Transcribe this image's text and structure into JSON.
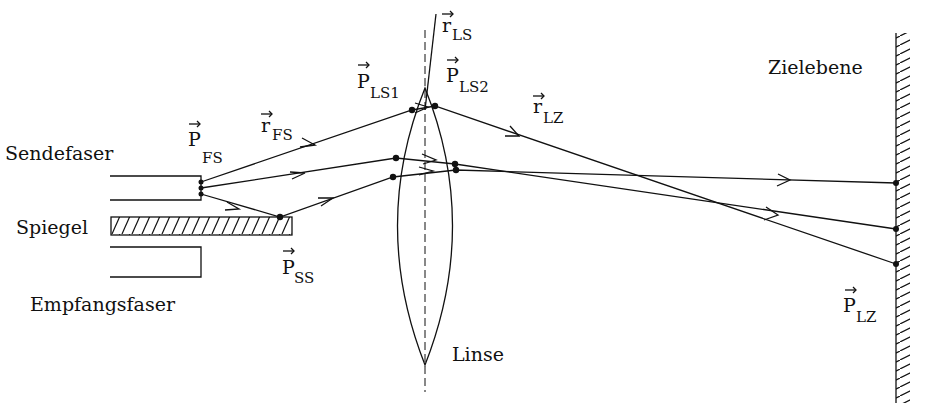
{
  "labels": {
    "sendefaser": "Sendefaser",
    "spiegel": "Spiegel",
    "empfangsfaser": "Empfangsfaser",
    "linse": "Linse",
    "zielebene": "Zielebene"
  },
  "vectors": {
    "p_fs": {
      "main": "P",
      "sub": "FS"
    },
    "r_fs": {
      "main": "r",
      "sub": "FS"
    },
    "p_ss": {
      "main": "P",
      "sub": "SS"
    },
    "p_ls1": {
      "main": "P",
      "sub": "LS1"
    },
    "p_ls2": {
      "main": "P",
      "sub": "LS2"
    },
    "r_ls": {
      "main": "r",
      "sub": "LS"
    },
    "r_lz": {
      "main": "r",
      "sub": "LZ"
    },
    "p_lz": {
      "main": "P",
      "sub": "LZ"
    }
  }
}
